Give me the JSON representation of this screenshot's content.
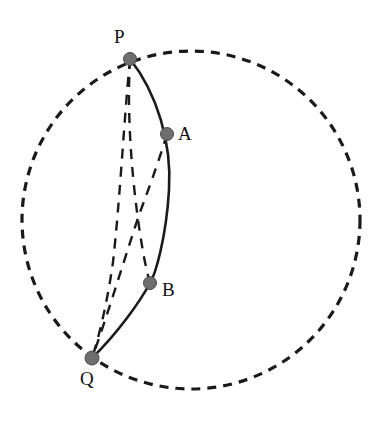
{
  "figure": {
    "width": 389,
    "height": 422,
    "background_color": "#ffffff"
  },
  "colors": {
    "stroke": "#1a1a1a",
    "dashed_stroke": "#1a1a1a",
    "point_fill": "#6e6e6e",
    "point_stroke": "#4a4a4a",
    "label_color": "#121212"
  },
  "boundary_circle": {
    "name": "boundary-circle",
    "cx": 191,
    "cy": 220,
    "r": 169,
    "style": "dashed",
    "dash_pattern": "9 7",
    "stroke_width": 3.2
  },
  "points": [
    {
      "id": "P",
      "label": "P",
      "x": 130,
      "y": 59,
      "r": 6.5,
      "label_x": 114,
      "label_y": 27
    },
    {
      "id": "A",
      "label": "A",
      "x": 167,
      "y": 134,
      "r": 6.5,
      "label_x": 178,
      "label_y": 124
    },
    {
      "id": "B",
      "label": "B",
      "x": 150,
      "y": 283,
      "r": 6.5,
      "label_x": 162,
      "label_y": 280
    },
    {
      "id": "Q",
      "label": "Q",
      "x": 92,
      "y": 358,
      "r": 7.0,
      "label_x": 80,
      "label_y": 369
    }
  ],
  "curves": [
    {
      "id": "arc-PQ",
      "name": "solid-geodesic-arc-PQ",
      "from": "P",
      "to": "Q",
      "through": [
        "A",
        "B"
      ],
      "style": "solid",
      "stroke_width": 2.6,
      "path": "M 130 59 C 157 93 172 143 169 190 C 166 240 155 275 150 283 C 141 300 118 333 92 358"
    },
    {
      "id": "chord-PB",
      "name": "dashed-chord-P-to-B",
      "from": "P",
      "to": "B",
      "style": "dashed",
      "stroke_width": 2.4,
      "dash_pattern": "10 8",
      "path": "M 130 59 C 127 110 131 165 137 212 C 141 243 146 270 150 283"
    },
    {
      "id": "chord-AQ",
      "name": "dashed-chord-A-to-Q",
      "from": "A",
      "to": "Q",
      "style": "dashed",
      "stroke_width": 2.4,
      "dash_pattern": "10 8",
      "path": "M 167 134 C 157 167 146 196 139 215 C 126 254 106 320 92 358"
    },
    {
      "id": "chord-PQ",
      "name": "dashed-chord-P-to-Q",
      "from": "P",
      "to": "Q",
      "style": "dashed",
      "stroke_width": 2.4,
      "dash_pattern": "10 8",
      "path": "M 130 59 C 124 120 120 200 113 262 C 107 305 98 340 92 358"
    }
  ]
}
